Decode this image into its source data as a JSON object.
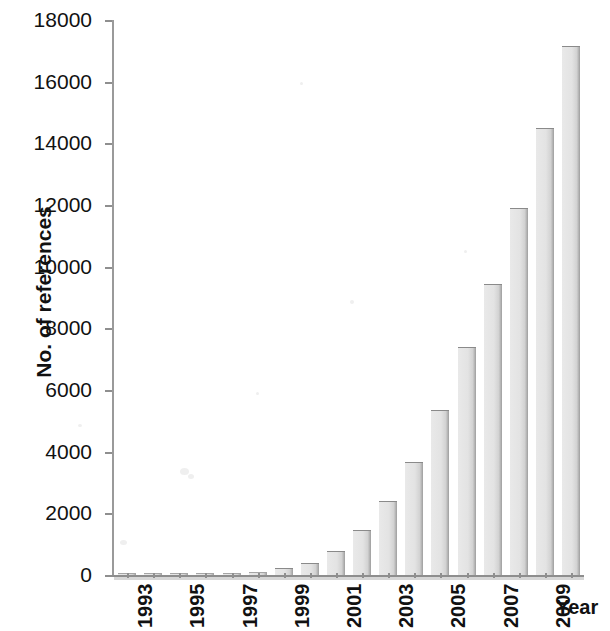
{
  "figure": {
    "background_color": "#ffffff",
    "bar_fill_color": "#e5e5e5",
    "bar_edge_color": "#8a8a8a",
    "axis_color": "#8f8f8f",
    "text_color": "#111111"
  },
  "axes": {
    "y_title": "No. of references",
    "x_title": "Year"
  },
  "chart_data": {
    "type": "bar",
    "title": "",
    "xlabel": "Year",
    "ylabel": "No. of references",
    "ylim": [
      0,
      18000
    ],
    "ytick_labels": [
      "0",
      "2000",
      "4000",
      "6000",
      "8000",
      "10000",
      "12000",
      "14000",
      "16000",
      "18000"
    ],
    "ytick_values": [
      0,
      2000,
      4000,
      6000,
      8000,
      10000,
      12000,
      14000,
      16000,
      18000
    ],
    "grid": false,
    "legend": false,
    "categories": [
      "1993",
      "1994",
      "1995",
      "1996",
      "1997",
      "1998",
      "1999",
      "2000",
      "2001",
      "2002",
      "2003",
      "2004",
      "2005",
      "2006",
      "2007",
      "2008",
      "2009",
      "2010"
    ],
    "xtick_labels_shown": [
      "1993",
      "1995",
      "1997",
      "1999",
      "2001",
      "2003",
      "2005",
      "2007",
      "2009"
    ],
    "values": [
      10,
      15,
      20,
      30,
      45,
      110,
      230,
      380,
      780,
      1450,
      2400,
      3650,
      5350,
      7400,
      9450,
      11900,
      14500,
      17150
    ]
  }
}
